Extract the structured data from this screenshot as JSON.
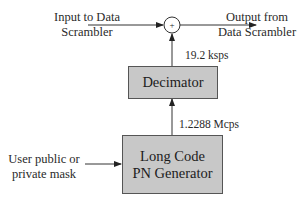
{
  "diagram": {
    "input_label": [
      "Input to Data",
      "Scrambler"
    ],
    "output_label": [
      "Output from",
      "Data Scrambler"
    ],
    "adder_symbol": "+",
    "rate_top": "19.2 ksps",
    "rate_bottom": "1.2288 Mcps",
    "decimator_label": "Decimator",
    "pn_generator_label": [
      "Long Code",
      "PN Generator"
    ],
    "mask_label": [
      "User public or",
      "private mask"
    ],
    "colors": {
      "box_fill": "#c8c8c8",
      "line": "#333333"
    }
  }
}
